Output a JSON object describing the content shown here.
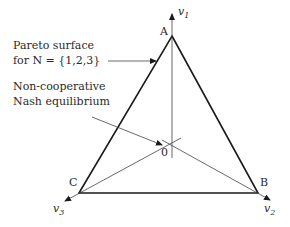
{
  "diagram": {
    "vertices": {
      "A": {
        "label": "A"
      },
      "B": {
        "label": "B"
      },
      "C": {
        "label": "C"
      }
    },
    "origin": {
      "label": "0"
    },
    "axes": [
      {
        "name": "v",
        "sub": "1"
      },
      {
        "name": "v",
        "sub": "2"
      },
      {
        "name": "v",
        "sub": "3"
      }
    ],
    "annotations": {
      "pareto_line1": "Pareto surface",
      "pareto_line2": "for N = {1,2,3}",
      "nash_line1": "Non-cooperative",
      "nash_line2": "Nash equilibrium"
    },
    "colors": {
      "stroke": "#1a1a1a",
      "thin_stroke": "#444444",
      "text": "#2a2a2a"
    }
  }
}
